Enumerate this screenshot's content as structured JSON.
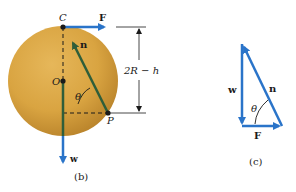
{
  "figure_b": {
    "caption": "(b)",
    "points": {
      "top": "C",
      "center": "O",
      "contact": "P"
    },
    "vectors": {
      "applied_force": "F",
      "normal_force": "n",
      "weight": "w"
    },
    "angle": "θ",
    "dimension": "2R − h"
  },
  "figure_c": {
    "caption": "(c)",
    "vectors": {
      "weight": "w",
      "normal_force": "n",
      "applied_force": "F"
    },
    "angle": "θ"
  },
  "colors": {
    "disc": "#d9a441",
    "disc_dark": "#b8822a",
    "vector_blue": "#2a74c9",
    "vector_green": "#2f5e3a",
    "dark": "#1a1a1a"
  }
}
